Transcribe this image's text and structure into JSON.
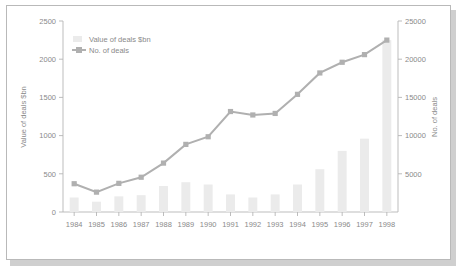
{
  "chart_data": {
    "type": "bar",
    "title": "",
    "subtitle": "",
    "categories": [
      "1984",
      "1985",
      "1986",
      "1987",
      "1988",
      "1989",
      "1990",
      "1991",
      "1992",
      "1993",
      "1994",
      "1995",
      "1996",
      "1997",
      "1998"
    ],
    "xlabel": "",
    "ylabel": "Value of deals $bn",
    "ylabel_right": "No. of deals",
    "ylim": [
      0,
      2500
    ],
    "ylim_right": [
      0,
      25000
    ],
    "yticks": [
      0,
      500,
      1000,
      1500,
      2000,
      2500
    ],
    "yticks_right": [
      0,
      5000,
      10000,
      15000,
      20000,
      25000
    ],
    "ytick_labels": [
      "0",
      "500",
      "1000",
      "1500",
      "2000",
      "2500"
    ],
    "ytick_labels_right": [
      "",
      "5000",
      "10000",
      "15000",
      "20000",
      "25000"
    ],
    "grid": false,
    "legend_position": "upper left",
    "series": [
      {
        "name": "Value of deals $bn",
        "type": "bar",
        "axis": "left",
        "color": "#ebebeb",
        "values": [
          190,
          135,
          205,
          220,
          340,
          390,
          360,
          230,
          190,
          230,
          360,
          560,
          800,
          960,
          2250
        ]
      },
      {
        "name": "No. of deals",
        "type": "line",
        "axis": "right",
        "color": "#b0b0b0",
        "values": [
          3700,
          2600,
          3750,
          4550,
          6400,
          8850,
          9850,
          13150,
          12700,
          12900,
          15400,
          18200,
          19600,
          20600,
          22500
        ]
      }
    ],
    "legend_entries": [
      "Value of deals $bn",
      "No. of deals"
    ]
  }
}
